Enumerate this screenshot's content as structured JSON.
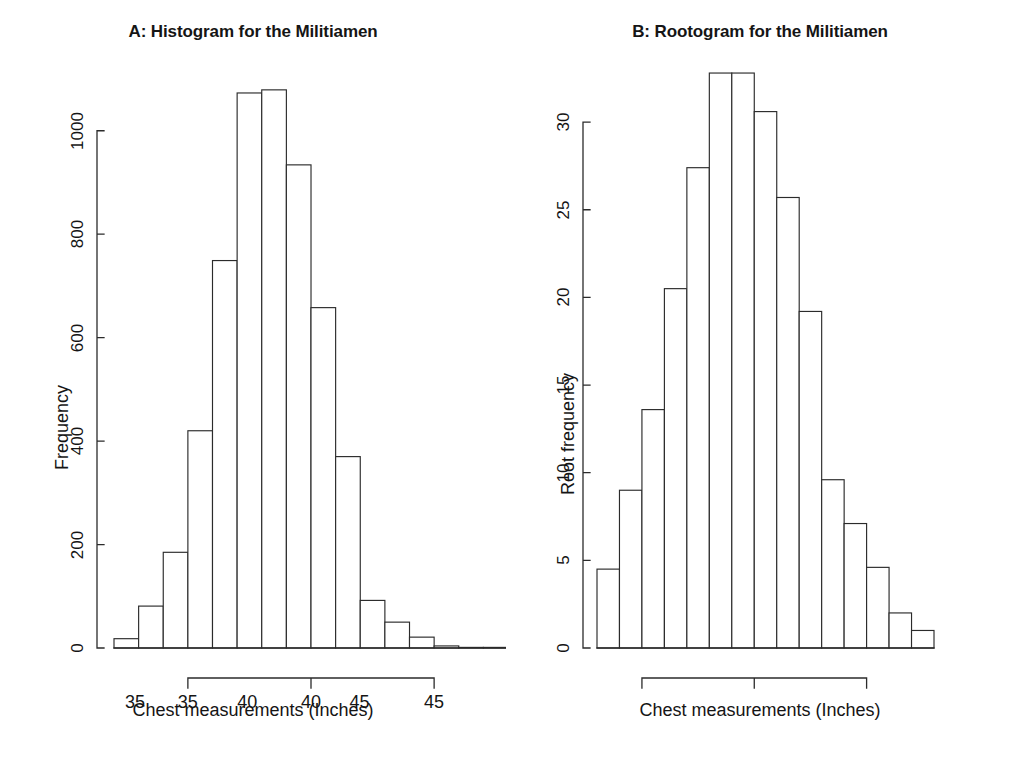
{
  "figure": {
    "background": "#ffffff",
    "ink_color": "#2b2b2b",
    "panels": [
      {
        "id": "panel-a",
        "title": "A: Histogram for the Militiamen",
        "xlabel": "Chest measurements (Inches)",
        "ylabel": "Frequency"
      },
      {
        "id": "panel-b",
        "title": "B: Rootogram for the Militiamen",
        "xlabel": "Chest measurements (Inches)",
        "ylabel": "Root frequency"
      }
    ]
  },
  "chart_data": [
    {
      "type": "bar",
      "id": "histogram",
      "title": "A: Histogram for the Militiamen",
      "xlabel": "Chest measurements (Inches)",
      "ylabel": "Frequency",
      "bin_width": 1,
      "bin_left_edges": [
        32,
        33,
        34,
        35,
        36,
        37,
        38,
        39,
        40,
        41,
        42,
        43,
        44,
        45,
        46,
        47
      ],
      "categories": [
        "32-33",
        "33-34",
        "34-35",
        "35-36",
        "36-37",
        "37-38",
        "38-39",
        "39-40",
        "40-41",
        "41-42",
        "42-43",
        "43-44",
        "44-45",
        "45-46",
        "46-47",
        "47-48"
      ],
      "values": [
        18,
        81,
        185,
        420,
        749,
        1073,
        1079,
        934,
        658,
        370,
        92,
        50,
        21,
        4,
        1,
        0
      ],
      "xlim": [
        32,
        48
      ],
      "ylim": [
        0,
        1100
      ],
      "xticks": [
        35,
        40,
        45
      ],
      "xtick_labels": [
        "35",
        "40",
        "45"
      ],
      "yticks": [
        0,
        200,
        400,
        600,
        800,
        1000
      ],
      "ytick_labels": [
        "0",
        "200",
        "400",
        "600",
        "800",
        "1000"
      ],
      "grid": false,
      "legend": "none"
    },
    {
      "type": "bar",
      "id": "rootogram",
      "title": "B: Rootogram for the Militiamen",
      "xlabel": "Chest measurements (Inches)",
      "ylabel": "Root frequency",
      "bin_width": 1,
      "bin_left_edges": [
        33,
        34,
        35,
        36,
        37,
        38,
        39,
        40,
        41,
        42,
        43,
        44,
        45,
        46,
        47
      ],
      "categories": [
        "33-34",
        "34-35",
        "35-36",
        "36-37",
        "37-38",
        "38-39",
        "39-40",
        "40-41",
        "41-42",
        "42-43",
        "43-44",
        "44-45",
        "45-46",
        "46-47",
        "47-48"
      ],
      "values": [
        4.5,
        9.0,
        13.6,
        20.5,
        27.4,
        32.8,
        32.8,
        30.6,
        25.7,
        19.2,
        9.6,
        7.1,
        4.6,
        2.0,
        1.0
      ],
      "xlim": [
        33,
        48
      ],
      "ylim": [
        0,
        34
      ],
      "xticks": [
        35,
        40,
        45
      ],
      "xtick_labels": [
        "35",
        "40",
        "45"
      ],
      "yticks": [
        0,
        5,
        10,
        15,
        20,
        25,
        30
      ],
      "ytick_labels": [
        "0",
        "5",
        "10",
        "15",
        "20",
        "25",
        "30"
      ],
      "grid": false,
      "legend": "none"
    }
  ]
}
